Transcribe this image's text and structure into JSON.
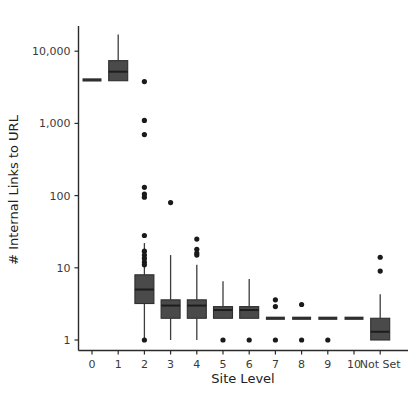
{
  "chart_data": {
    "type": "bar",
    "plot_kind": "box",
    "title": "",
    "xlabel": "Site Level",
    "ylabel": "# Internal Links to URL",
    "yscale": "log",
    "ylim": [
      0.62,
      40000
    ],
    "grid": false,
    "legend": null,
    "categories": [
      "0",
      "1",
      "2",
      "3",
      "4",
      "5",
      "6",
      "7",
      "8",
      "9",
      "10",
      "Not Set"
    ],
    "ytick_labels": [
      "1",
      "10",
      "100",
      "1,000",
      "10,000"
    ],
    "ytick_values": [
      1,
      10,
      100,
      1000,
      10000
    ],
    "box_color": "#4a4a4a",
    "line_color": "#2e2e2e",
    "flier_color": "#1a1a1a",
    "boxes": [
      {
        "category": "0",
        "whisker_low": 4000,
        "q1": 4000,
        "median": 4000,
        "q3": 4000,
        "whisker_high": 4000,
        "fliers": []
      },
      {
        "category": "1",
        "whisker_low": 4300,
        "q1": 3900,
        "median": 5200,
        "q3": 7400,
        "whisker_high": 17000,
        "fliers": []
      },
      {
        "category": "2",
        "whisker_low": 1.0,
        "q1": 3.2,
        "median": 5.0,
        "q3": 8.0,
        "whisker_high": 22,
        "fliers": [
          3800,
          1100,
          700,
          130,
          105,
          95,
          28,
          17,
          15,
          13.5,
          12,
          11,
          1.0
        ]
      },
      {
        "category": "3",
        "whisker_low": 1.0,
        "q1": 2.0,
        "median": 3.0,
        "q3": 3.6,
        "whisker_high": 15,
        "fliers": [
          80
        ]
      },
      {
        "category": "4",
        "whisker_low": 1.0,
        "q1": 2.0,
        "median": 3.0,
        "q3": 3.6,
        "whisker_high": 11,
        "fliers": [
          25,
          18,
          16,
          15
        ]
      },
      {
        "category": "5",
        "whisker_low": 2.0,
        "q1": 2.0,
        "median": 2.6,
        "q3": 2.9,
        "whisker_high": 6.5,
        "fliers": [
          1.0
        ]
      },
      {
        "category": "6",
        "whisker_low": 2.0,
        "q1": 2.0,
        "median": 2.6,
        "q3": 2.9,
        "whisker_high": 7.0,
        "fliers": [
          1.0
        ]
      },
      {
        "category": "7",
        "whisker_low": 2.0,
        "q1": 2.0,
        "median": 2.0,
        "q3": 2.0,
        "whisker_high": 2.0,
        "fliers": [
          3.6,
          2.9,
          1.0
        ]
      },
      {
        "category": "8",
        "whisker_low": 2.0,
        "q1": 2.0,
        "median": 2.0,
        "q3": 2.0,
        "whisker_high": 2.0,
        "fliers": [
          3.1,
          1.0
        ]
      },
      {
        "category": "9",
        "whisker_low": 2.0,
        "q1": 2.0,
        "median": 2.0,
        "q3": 2.0,
        "whisker_high": 2.0,
        "fliers": [
          1.0
        ]
      },
      {
        "category": "10",
        "whisker_low": 2.0,
        "q1": 2.0,
        "median": 2.0,
        "q3": 2.0,
        "whisker_high": 2.0,
        "fliers": []
      },
      {
        "category": "Not Set",
        "whisker_low": 1.0,
        "q1": 1.0,
        "median": 1.3,
        "q3": 2.0,
        "whisker_high": 4.3,
        "fliers": [
          14,
          9
        ]
      }
    ]
  }
}
